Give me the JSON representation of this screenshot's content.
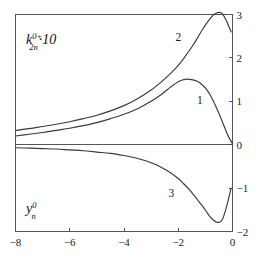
{
  "figure": {
    "background_color": "#ffffff",
    "frame_color": "#555555",
    "curve_color": "#3a3a3a",
    "ylabel_top": {
      "symbol": "k",
      "superscript": "0+",
      "subscript": "2n",
      "suffix": "·10",
      "full_text": "k(0+,2n)·10"
    },
    "ylabel_bottom": {
      "symbol": "y",
      "superscript": "0",
      "subscript": "n",
      "full_text": "y(0,n)"
    }
  },
  "chart_data": {
    "type": "line",
    "title": "",
    "xlabel": "",
    "ylabel": "",
    "xlim": [
      -8,
      0
    ],
    "ylim": [
      -2,
      3
    ],
    "xticks": [
      -8,
      -6,
      -4,
      -2,
      0
    ],
    "xtick_labels": [
      "-8",
      "-6",
      "-4",
      "-2",
      "0"
    ],
    "yticks": [
      -2,
      -1,
      0,
      1,
      2,
      3
    ],
    "ytick_labels": [
      "-2",
      "-1",
      "0",
      "1",
      "2",
      "3"
    ],
    "y_axis_position": "right",
    "grid": false,
    "legend": "inline-curve-numbers",
    "annotations": [
      {
        "text": "k_{2n}^{0+}·10",
        "x": -7.2,
        "y": 2.55
      },
      {
        "text": "y_{n}^{0}",
        "x": -7.2,
        "y": -1.45
      },
      {
        "text": "1",
        "x": -1.2,
        "y": 0.93
      },
      {
        "text": "2",
        "x": -2.0,
        "y": 2.38
      },
      {
        "text": "3",
        "x": -2.25,
        "y": -1.21
      }
    ],
    "series": [
      {
        "name": "1",
        "label": "1",
        "x": [
          -8.0,
          -7.5,
          -7.0,
          -6.5,
          -6.0,
          -5.5,
          -5.0,
          -4.5,
          -4.0,
          -3.5,
          -3.0,
          -2.6,
          -2.3,
          -2.0,
          -1.8,
          -1.7,
          -1.5,
          -1.3,
          -1.1,
          -0.95,
          -0.8,
          -0.65,
          -0.5,
          -0.35,
          -0.2,
          -0.1,
          0.0
        ],
        "y": [
          0.2,
          0.24,
          0.28,
          0.33,
          0.38,
          0.44,
          0.51,
          0.6,
          0.7,
          0.83,
          1.0,
          1.17,
          1.32,
          1.45,
          1.5,
          1.51,
          1.5,
          1.46,
          1.37,
          1.27,
          1.12,
          0.93,
          0.72,
          0.49,
          0.26,
          0.13,
          0.02
        ]
      },
      {
        "name": "2",
        "label": "2",
        "x": [
          -8.0,
          -7.5,
          -7.0,
          -6.5,
          -6.0,
          -5.5,
          -5.0,
          -4.5,
          -4.0,
          -3.5,
          -3.0,
          -2.6,
          -2.3,
          -2.0,
          -1.75,
          -1.5,
          -1.3,
          -1.1,
          -0.95,
          -0.8,
          -0.7,
          -0.6,
          -0.5,
          -0.42,
          -0.35,
          -0.28,
          -0.2,
          -0.12,
          -0.05
        ],
        "y": [
          0.33,
          0.37,
          0.42,
          0.47,
          0.53,
          0.6,
          0.68,
          0.78,
          0.9,
          1.06,
          1.26,
          1.46,
          1.63,
          1.83,
          2.03,
          2.25,
          2.45,
          2.66,
          2.8,
          2.92,
          2.99,
          3.03,
          3.05,
          3.04,
          3.0,
          2.92,
          2.82,
          2.7,
          2.6
        ]
      },
      {
        "name": "3",
        "label": "3",
        "x": [
          -8.0,
          -7.5,
          -7.0,
          -6.5,
          -6.0,
          -5.5,
          -5.0,
          -4.5,
          -4.0,
          -3.6,
          -3.2,
          -2.9,
          -2.6,
          -2.3,
          -2.0,
          -1.8,
          -1.6,
          -1.4,
          -1.2,
          -1.05,
          -0.9,
          -0.8,
          -0.7,
          -0.6,
          -0.5,
          -0.42,
          -0.35,
          -0.28,
          -0.2,
          -0.12,
          -0.05
        ],
        "y": [
          -0.07,
          -0.08,
          -0.09,
          -0.1,
          -0.12,
          -0.14,
          -0.17,
          -0.2,
          -0.25,
          -0.3,
          -0.37,
          -0.44,
          -0.53,
          -0.64,
          -0.78,
          -0.9,
          -1.03,
          -1.18,
          -1.34,
          -1.46,
          -1.6,
          -1.68,
          -1.74,
          -1.78,
          -1.79,
          -1.76,
          -1.69,
          -1.56,
          -1.38,
          -1.18,
          -1.0
        ]
      }
    ]
  }
}
